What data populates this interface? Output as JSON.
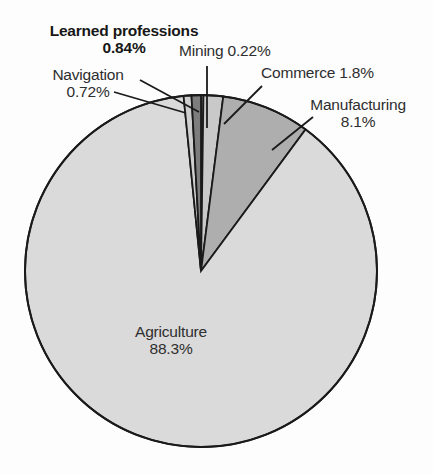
{
  "chart_data": {
    "type": "pie",
    "title": "",
    "subtitle": "",
    "legend_position": "callout-labels",
    "grid": false,
    "units": "percent",
    "center": {
      "x": 201,
      "y": 271
    },
    "radius": 176,
    "start_angle_deg": 0,
    "direction": "clockwise",
    "categories": [
      "Mining",
      "Commerce",
      "Manufacturing",
      "Agriculture",
      "Navigation",
      "Learned professions"
    ],
    "values": [
      0.22,
      1.8,
      8.1,
      88.3,
      0.72,
      0.84
    ],
    "value_labels": [
      "0.22%",
      "1.8%",
      "8.1%",
      "88.3%",
      "0.72%",
      "0.84%"
    ],
    "slices": [
      {
        "name": "Mining",
        "label": "Mining 0.22%",
        "value": 0.22,
        "value_text": "0.22%",
        "color": "#d2d2d2",
        "start_deg": 0,
        "end_deg": 0.792
      },
      {
        "name": "Commerce",
        "label": "Commerce 1.8%",
        "value": 1.8,
        "value_text": "1.8%",
        "color": "#c9c9c9",
        "start_deg": 0.792,
        "end_deg": 7.272
      },
      {
        "name": "Manufacturing",
        "label": "Manufacturing 8.1%",
        "value": 8.1,
        "value_text": "8.1%",
        "color": "#aeaeae",
        "start_deg": 7.272,
        "end_deg": 36.432
      },
      {
        "name": "Agriculture",
        "label": "Agriculture 88.3%",
        "value": 88.3,
        "value_text": "88.3%",
        "color": "#dadada",
        "start_deg": 36.432,
        "end_deg": 354.312
      },
      {
        "name": "Navigation",
        "label": "Navigation 0.72%",
        "value": 0.72,
        "value_text": "0.72%",
        "color": "#cfcfcf",
        "start_deg": 354.312,
        "end_deg": 356.904
      },
      {
        "name": "Learned professions",
        "label": "Learned professions 0.84%",
        "value": 0.84,
        "value_text": "0.84%",
        "color": "#7d7d7d",
        "start_deg": 356.904,
        "end_deg": 360
      }
    ],
    "colors": {
      "outline": "#1a1a1a",
      "background": "#fdfdfd",
      "text": "#2e2e2e",
      "text_bold": "#171717"
    }
  },
  "labels": {
    "learned_professions": {
      "name": "Learned professions",
      "value": "0.84%"
    },
    "navigation": {
      "name": "Navigation",
      "value": "0.72%"
    },
    "mining": {
      "text": "Mining 0.22%"
    },
    "commerce": {
      "text": "Commerce 1.8%"
    },
    "manufacturing": {
      "name": "Manufacturing",
      "value": "8.1%"
    },
    "agriculture": {
      "name": "Agriculture",
      "value": "88.3%"
    }
  }
}
